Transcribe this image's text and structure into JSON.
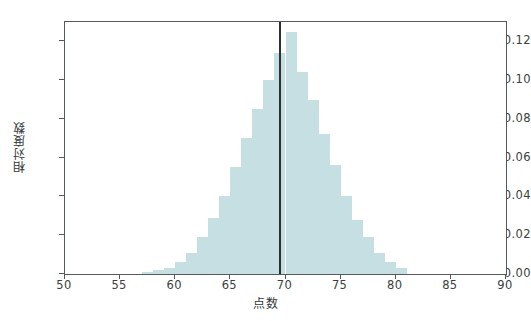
{
  "chart_data": {
    "type": "bar",
    "title": "",
    "subtitle": "",
    "xlabel": "点数",
    "ylabel": "相対度数",
    "xlim": [
      50,
      90
    ],
    "ylim": [
      0.0,
      0.13
    ],
    "grid": false,
    "legend": null,
    "bin_width": 1,
    "bar_color": "#c6dfe3",
    "x_ticks": [
      50,
      55,
      60,
      65,
      70,
      75,
      80,
      85,
      90
    ],
    "x_tick_labels": [
      "50",
      "55",
      "60",
      "65",
      "70",
      "75",
      "80",
      "85",
      "90"
    ],
    "y_ticks": [
      0.0,
      0.02,
      0.04,
      0.06,
      0.08,
      0.1,
      0.12
    ],
    "y_tick_labels": [
      "0.00",
      "0.02",
      "0.04",
      "0.06",
      "0.08",
      "0.10",
      "0.12"
    ],
    "annotations": [
      {
        "name": "mean-line",
        "kind": "vline",
        "x": 69.5,
        "color": "#2b2f31"
      }
    ],
    "categories": [
      57,
      58,
      59,
      60,
      61,
      62,
      63,
      64,
      65,
      66,
      67,
      68,
      69,
      70,
      71,
      72,
      73,
      74,
      75,
      76,
      77,
      78,
      79,
      80
    ],
    "values": [
      0.001,
      0.002,
      0.003,
      0.006,
      0.011,
      0.019,
      0.029,
      0.04,
      0.055,
      0.07,
      0.085,
      0.1,
      0.114,
      0.125,
      0.104,
      0.09,
      0.072,
      0.056,
      0.04,
      0.028,
      0.019,
      0.011,
      0.006,
      0.003
    ]
  }
}
